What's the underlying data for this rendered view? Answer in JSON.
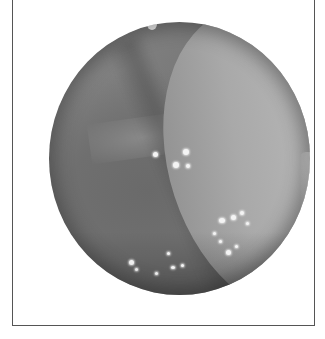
{
  "image": {
    "subject": "endoscopic-view",
    "description": "Circular grayscale endoscopic image of mucosal tissue with a lighter fold on the right and scattered bright specular highlights",
    "colors": {
      "frame_border": "#555555",
      "background": "#ffffff",
      "tissue_dark": "#5e5e5e",
      "tissue_light": "#b8b8b8",
      "highlight": "#f4f4f4"
    }
  }
}
